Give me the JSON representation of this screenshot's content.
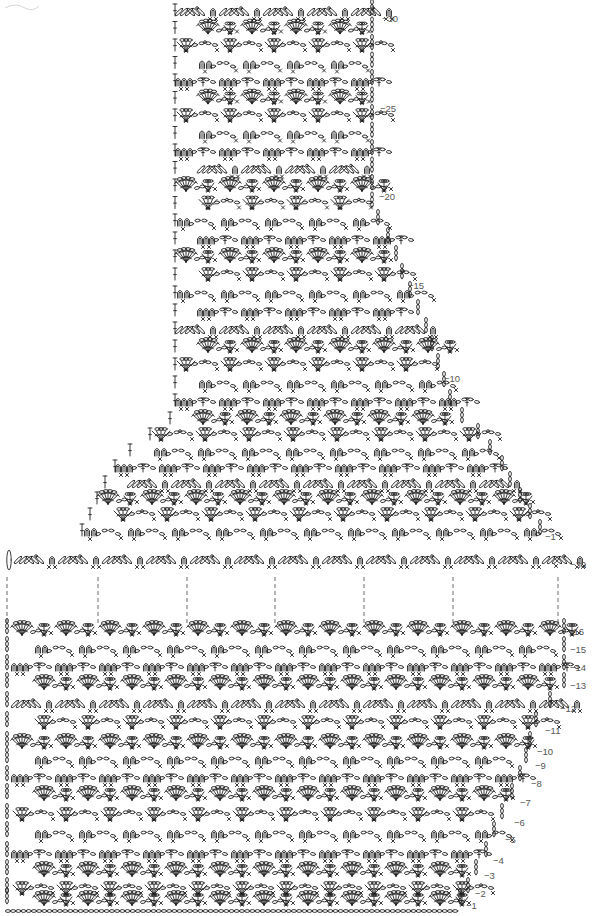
{
  "diagram": {
    "type": "crochet-chart",
    "stitch_symbols": [
      "chain-oval",
      "single-crochet-x",
      "double-crochet-t",
      "shell-fan",
      "picot-loop",
      "slip-stitch-dot"
    ],
    "upper_piece": {
      "name": "yoke-piece",
      "row_labels": [
        {
          "row": 30,
          "text": "−30"
        },
        {
          "row": 25,
          "text": "−25"
        },
        {
          "row": 20,
          "text": "−20"
        },
        {
          "row": 15,
          "text": "−15"
        },
        {
          "row": 10,
          "text": "−10"
        },
        {
          "row": 5,
          "text": "−5"
        },
        {
          "row": 1,
          "text": "−1"
        }
      ],
      "total_rows": 30
    },
    "joining_row": {
      "row": 30,
      "text": "−30",
      "guide_count": 7
    },
    "lower_piece": {
      "name": "body-piece",
      "row_labels": [
        {
          "row": 16,
          "text": "−16"
        },
        {
          "row": 15,
          "text": "−15"
        },
        {
          "row": 14,
          "text": "−14"
        },
        {
          "row": 13,
          "text": "−13"
        },
        {
          "row": 12,
          "text": "−12"
        },
        {
          "row": 11,
          "text": "−11"
        },
        {
          "row": 10,
          "text": "−10"
        },
        {
          "row": 9,
          "text": "−9"
        },
        {
          "row": 8,
          "text": "−8"
        },
        {
          "row": 7,
          "text": "−7"
        },
        {
          "row": 6,
          "text": "−6"
        },
        {
          "row": 5,
          "text": "−5"
        },
        {
          "row": 4,
          "text": "−4"
        },
        {
          "row": 3,
          "text": "−3"
        },
        {
          "row": 2,
          "text": "−2"
        },
        {
          "row": 1,
          "text": "−1"
        }
      ],
      "total_rows": 16
    },
    "colors": {
      "ink": "#222222",
      "label": "#555555",
      "background": "#ffffff"
    }
  }
}
